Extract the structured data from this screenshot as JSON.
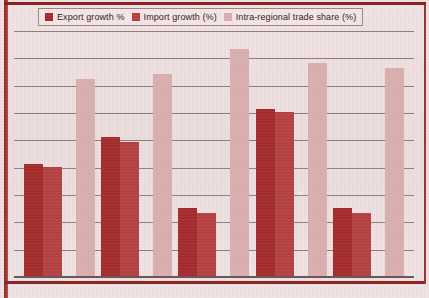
{
  "legend": {
    "items": [
      {
        "label": "Export growth %",
        "color": "#a32b2b",
        "icon": "legend-swatch-icon"
      },
      {
        "label": "Import growth (%)",
        "color": "#b44141",
        "icon": "legend-swatch-icon"
      },
      {
        "label": "Intra-regional trade share (%)",
        "color": "#d8aeae",
        "icon": "legend-swatch-icon"
      }
    ]
  },
  "colors": {
    "series1": "#a32b2b",
    "series2": "#b44141",
    "series3": "#d8aeae",
    "grid": "#5d4747",
    "axis": "#6b5151",
    "border": "#8d2222",
    "page_background": "#efdfdf"
  },
  "chart_data": {
    "type": "bar",
    "title": "",
    "xlabel": "",
    "ylabel": "",
    "categories": [
      "1",
      "2",
      "3",
      "4",
      "5"
    ],
    "ylim": [
      0,
      9
    ],
    "grid": true,
    "gridlines": [
      1,
      2,
      3,
      4,
      5,
      6,
      7,
      8,
      9
    ],
    "legend_position": "top",
    "xtick_labels": [],
    "ytick_labels": [],
    "series": [
      {
        "name": "Export growth %",
        "color": "#a32b2b",
        "values": [
          4.1,
          5.1,
          2.5,
          6.1,
          2.5
        ]
      },
      {
        "name": "Import growth (%)",
        "color": "#b44141",
        "values": [
          4.0,
          4.9,
          2.3,
          6.0,
          2.3
        ]
      },
      {
        "name": "Intra-regional trade share (%)",
        "color": "#d8aeae",
        "values": [
          7.2,
          7.4,
          8.3,
          7.8,
          7.6
        ]
      }
    ]
  }
}
